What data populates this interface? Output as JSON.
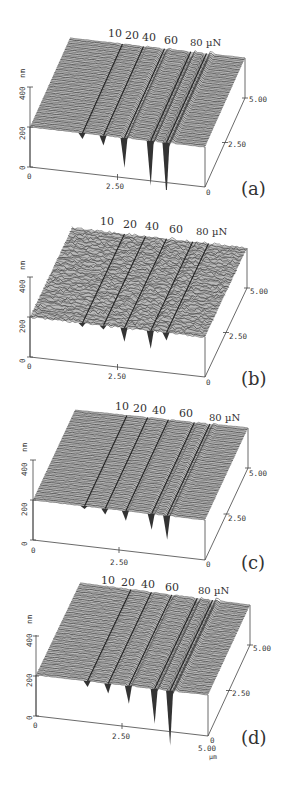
{
  "figure": {
    "force_unit": "µN",
    "panels": [
      {
        "id": "a",
        "label": "(a)",
        "forces": [
          "10",
          "20",
          "40",
          "60",
          "80 µN"
        ],
        "z_unit": "nm",
        "z_ticks": [
          "0",
          "200",
          "400"
        ],
        "x_ticks": [
          "0",
          "2.50",
          "5.00"
        ],
        "y_ticks": [
          "0",
          "2.50",
          "5.00"
        ],
        "noise": 0.6,
        "depths": [
          6,
          10,
          30,
          45,
          55
        ]
      },
      {
        "id": "b",
        "label": "(b)",
        "forces": [
          "10",
          "20",
          "40",
          "60",
          "80 µN"
        ],
        "z_unit": "nm",
        "z_ticks": [
          "0",
          "200",
          "400"
        ],
        "x_ticks": [
          "0",
          "2.50",
          "5.00"
        ],
        "y_ticks": [
          "0",
          "2.50",
          "5.00"
        ],
        "noise": 3,
        "depths": [
          4,
          4,
          14,
          18,
          8
        ]
      },
      {
        "id": "c",
        "label": "(c)",
        "forces": [
          "10",
          "20",
          "40",
          "60",
          "80 µN"
        ],
        "z_unit": "nm",
        "z_ticks": [
          "0",
          "200",
          "400"
        ],
        "x_ticks": [
          "0",
          "2.50",
          "5.00"
        ],
        "y_ticks": [
          "0",
          "2.50",
          "5.00"
        ],
        "noise": 0.6,
        "depths": [
          3,
          6,
          10,
          16,
          24
        ]
      },
      {
        "id": "d",
        "label": "(d)",
        "forces": [
          "10",
          "20",
          "40",
          "60",
          "80 µN"
        ],
        "z_unit": "nm",
        "z_ticks": [
          "0",
          "200",
          "400"
        ],
        "x_ticks": [
          "0",
          "2.50",
          "5.00"
        ],
        "y_ticks": [
          "0",
          "2.50",
          "5.00"
        ],
        "noise": 0.8,
        "depths": [
          6,
          10,
          18,
          35,
          55
        ],
        "xy_unit": "µm"
      }
    ]
  },
  "chart_data": [
    {
      "type": "surface3d",
      "title": "(a)",
      "xlabel": "µm",
      "ylabel": "µm",
      "zlabel": "nm",
      "xlim": [
        0,
        5
      ],
      "ylim": [
        0,
        5
      ],
      "zlim": [
        0,
        400
      ],
      "annotations": [
        "10",
        "20",
        "40",
        "60",
        "80 µN"
      ],
      "scratch_loads_uN": [
        10,
        20,
        40,
        60,
        80
      ],
      "surface_height_nm": 200
    },
    {
      "type": "surface3d",
      "title": "(b)",
      "xlabel": "µm",
      "ylabel": "µm",
      "zlabel": "nm",
      "xlim": [
        0,
        5
      ],
      "ylim": [
        0,
        5
      ],
      "zlim": [
        0,
        400
      ],
      "annotations": [
        "10",
        "20",
        "40",
        "60",
        "80 µN"
      ],
      "scratch_loads_uN": [
        10,
        20,
        40,
        60,
        80
      ],
      "surface_height_nm": 200
    },
    {
      "type": "surface3d",
      "title": "(c)",
      "xlabel": "µm",
      "ylabel": "µm",
      "zlabel": "nm",
      "xlim": [
        0,
        5
      ],
      "ylim": [
        0,
        5
      ],
      "zlim": [
        0,
        400
      ],
      "annotations": [
        "10",
        "20",
        "40",
        "60",
        "80 µN"
      ],
      "scratch_loads_uN": [
        10,
        20,
        40,
        60,
        80
      ],
      "surface_height_nm": 200
    },
    {
      "type": "surface3d",
      "title": "(d)",
      "xlabel": "µm",
      "ylabel": "µm",
      "zlabel": "nm",
      "xlim": [
        0,
        5
      ],
      "ylim": [
        0,
        5
      ],
      "zlim": [
        0,
        400
      ],
      "annotations": [
        "10",
        "20",
        "40",
        "60",
        "80 µN"
      ],
      "scratch_loads_uN": [
        10,
        20,
        40,
        60,
        80
      ],
      "surface_height_nm": 200
    }
  ]
}
